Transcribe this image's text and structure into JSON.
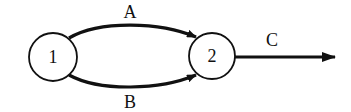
{
  "diagram": {
    "type": "flow-network",
    "nodes": [
      {
        "id": "1",
        "label": "1",
        "cx": 53,
        "cy": 57,
        "r": 24
      },
      {
        "id": "2",
        "label": "2",
        "cx": 212,
        "cy": 56,
        "r": 23
      }
    ],
    "edges": [
      {
        "id": "A",
        "label": "A",
        "from": "1",
        "to": "2",
        "position": "upper-arc"
      },
      {
        "id": "B",
        "label": "B",
        "from": "1",
        "to": "2",
        "position": "lower-arc"
      },
      {
        "id": "C",
        "label": "C",
        "from": "2",
        "to": "out",
        "position": "straight-right"
      }
    ],
    "colors": {
      "stroke": "#111111",
      "background": "#ffffff"
    }
  }
}
